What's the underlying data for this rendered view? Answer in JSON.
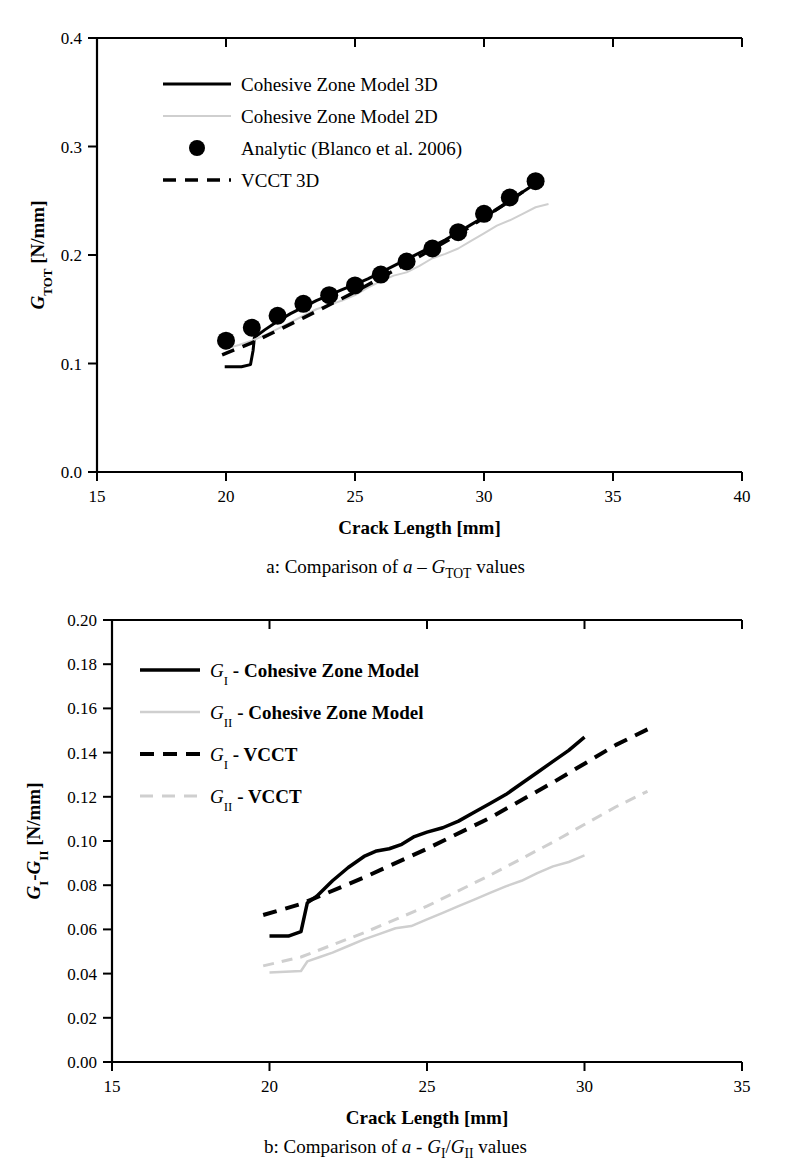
{
  "figure": {
    "panels": [
      {
        "id": "a",
        "caption_prefix": "a: Comparison of ",
        "caption_italic": "a",
        "caption_mid": " – ",
        "caption_sym": "G",
        "caption_sub": "TOT",
        "caption_suffix": " values"
      },
      {
        "id": "b",
        "caption_prefix": "b: Comparison of ",
        "caption_italic": "a",
        "caption_mid": " - ",
        "caption_sym1": "G",
        "caption_sub1": "I",
        "caption_slash": "/",
        "caption_sym2": "G",
        "caption_sub2": "II",
        "caption_suffix": " values"
      }
    ]
  },
  "chart_data": [
    {
      "type": "line",
      "panel": "a",
      "title": "",
      "xlabel": "Crack Length [mm]",
      "ylabel": "G_TOT [N/mm]",
      "ylabel_sym": "G",
      "ylabel_sub": "TOT",
      "ylabel_unit": " [N/mm]",
      "xlim": [
        15,
        40
      ],
      "ylim": [
        0.0,
        0.4
      ],
      "xticks": [
        15,
        20,
        25,
        30,
        35,
        40
      ],
      "xticklabels": [
        "15",
        "20",
        "25",
        "30",
        "35",
        "40"
      ],
      "yticks": [
        0.0,
        0.1,
        0.2,
        0.3,
        0.4
      ],
      "yticklabels": [
        "0.0",
        "0.1",
        "0.2",
        "0.3",
        "0.4"
      ],
      "grid": false,
      "legend_position": "upper-left",
      "series": [
        {
          "name": "Cohesive Zone Model 3D",
          "style": "solid",
          "color": "#000000",
          "width": 3,
          "x": [
            19.95,
            20.6,
            20.95,
            21.05,
            21.1,
            21.5,
            22.0,
            22.5,
            23.0,
            23.5,
            24.0,
            24.5,
            25.0,
            25.5,
            26.0,
            26.5,
            27.0,
            27.5,
            28.0,
            28.5,
            29.0,
            29.5,
            30.0,
            30.5,
            31.0,
            31.5,
            32.0
          ],
          "y": [
            0.097,
            0.097,
            0.099,
            0.112,
            0.124,
            0.131,
            0.139,
            0.146,
            0.152,
            0.158,
            0.163,
            0.168,
            0.173,
            0.178,
            0.184,
            0.19,
            0.196,
            0.202,
            0.208,
            0.214,
            0.221,
            0.228,
            0.235,
            0.242,
            0.25,
            0.258,
            0.266
          ]
        },
        {
          "name": "Cohesive Zone Model 2D",
          "style": "solid",
          "color": "#cfcfcf",
          "width": 2,
          "x": [
            19.9,
            20.5,
            21.0,
            21.5,
            22.0,
            22.5,
            23.0,
            23.5,
            24.0,
            24.5,
            25.0,
            25.5,
            26.0,
            26.5,
            27.0,
            27.5,
            28.0,
            28.5,
            29.0,
            29.5,
            30.0,
            30.5,
            31.0,
            31.5,
            32.0,
            32.5
          ],
          "y": [
            0.113,
            0.117,
            0.121,
            0.126,
            0.132,
            0.138,
            0.144,
            0.15,
            0.154,
            0.158,
            0.163,
            0.17,
            0.176,
            0.181,
            0.184,
            0.19,
            0.197,
            0.201,
            0.206,
            0.213,
            0.22,
            0.227,
            0.232,
            0.238,
            0.244,
            0.247
          ]
        },
        {
          "name": "Analytic (Blanco et al. 2006)",
          "style": "markers",
          "color": "#000000",
          "marker": "circle",
          "marker_size": 9,
          "x": [
            20,
            21,
            22,
            23,
            24,
            25,
            26,
            27,
            28,
            29,
            30,
            31,
            32
          ],
          "y": [
            0.121,
            0.133,
            0.144,
            0.155,
            0.163,
            0.172,
            0.182,
            0.194,
            0.206,
            0.221,
            0.238,
            0.253,
            0.268
          ]
        },
        {
          "name": "VCCT 3D",
          "style": "dashed",
          "color": "#000000",
          "width": 3.5,
          "x": [
            19.85,
            21.0,
            23.0,
            25.0,
            27.0,
            29.0,
            31.0,
            32.1
          ],
          "y": [
            0.108,
            0.119,
            0.142,
            0.166,
            0.192,
            0.219,
            0.25,
            0.268
          ]
        }
      ],
      "legend": [
        {
          "label": "Cohesive Zone Model 3D",
          "style": "solid",
          "color": "#000000",
          "width": 3
        },
        {
          "label": "Cohesive Zone Model 2D",
          "style": "solid",
          "color": "#cfcfcf",
          "width": 2
        },
        {
          "label": "Analytic (Blanco et al. 2006)",
          "style": "marker",
          "color": "#000000"
        },
        {
          "label": "VCCT 3D",
          "style": "dashed",
          "color": "#000000",
          "width": 3.5
        }
      ]
    },
    {
      "type": "line",
      "panel": "b",
      "title": "",
      "xlabel": "Crack Length [mm]",
      "ylabel": "G_I-G_II [N/mm]",
      "ylabel_sym1": "G",
      "ylabel_sub1": "I",
      "ylabel_dash": "-",
      "ylabel_sym2": "G",
      "ylabel_sub2": "II",
      "ylabel_unit": " [N/mm]",
      "xlim": [
        15,
        35
      ],
      "ylim": [
        0.0,
        0.2
      ],
      "xticks": [
        15,
        20,
        25,
        30,
        35
      ],
      "xticklabels": [
        "15",
        "20",
        "25",
        "30",
        "35"
      ],
      "yticks": [
        0.0,
        0.02,
        0.04,
        0.06,
        0.08,
        0.1,
        0.12,
        0.14,
        0.16,
        0.18,
        0.2
      ],
      "yticklabels": [
        "0.00",
        "0.02",
        "0.04",
        "0.06",
        "0.08",
        "0.10",
        "0.12",
        "0.14",
        "0.16",
        "0.18",
        "0.20"
      ],
      "grid": false,
      "legend_position": "upper-left",
      "series": [
        {
          "name": "G_I - Cohesive Zone Model",
          "style": "solid",
          "color": "#000000",
          "width": 3.5,
          "x": [
            20.0,
            20.6,
            21.0,
            21.2,
            21.5,
            22.0,
            22.5,
            23.0,
            23.4,
            23.8,
            24.2,
            24.6,
            25.0,
            25.5,
            26.0,
            26.5,
            27.0,
            27.5,
            28.0,
            28.5,
            29.0,
            29.5,
            30.0
          ],
          "y": [
            0.057,
            0.057,
            0.059,
            0.072,
            0.075,
            0.082,
            0.088,
            0.093,
            0.0955,
            0.0965,
            0.0985,
            0.102,
            0.104,
            0.106,
            0.109,
            0.113,
            0.117,
            0.121,
            0.126,
            0.131,
            0.136,
            0.141,
            0.147
          ]
        },
        {
          "name": "G_II - Cohesive Zone Model",
          "style": "solid",
          "color": "#cfcfcf",
          "width": 2.5,
          "x": [
            20.0,
            20.5,
            21.0,
            21.2,
            21.6,
            22.0,
            22.5,
            23.0,
            23.5,
            24.0,
            24.5,
            25.0,
            25.5,
            26.0,
            26.5,
            27.0,
            27.5,
            28.0,
            28.5,
            29.0,
            29.5,
            30.0
          ],
          "y": [
            0.0405,
            0.0408,
            0.0412,
            0.0455,
            0.0475,
            0.0495,
            0.0525,
            0.0555,
            0.058,
            0.0605,
            0.0615,
            0.0645,
            0.0675,
            0.0705,
            0.0735,
            0.0765,
            0.0795,
            0.082,
            0.0855,
            0.0885,
            0.0905,
            0.0935
          ]
        },
        {
          "name": "G_I - VCCT",
          "style": "dashed",
          "color": "#000000",
          "width": 4,
          "x": [
            19.8,
            21.0,
            23.0,
            25.0,
            27.0,
            29.0,
            31.0,
            32.0
          ],
          "y": [
            0.0665,
            0.0715,
            0.0835,
            0.0965,
            0.1105,
            0.1265,
            0.1435,
            0.1505
          ]
        },
        {
          "name": "G_II - VCCT",
          "style": "dashed",
          "color": "#cfcfcf",
          "width": 3,
          "x": [
            19.8,
            21.0,
            23.0,
            25.0,
            27.0,
            29.0,
            31.0,
            32.0
          ],
          "y": [
            0.0435,
            0.0475,
            0.0585,
            0.0705,
            0.0845,
            0.0995,
            0.1155,
            0.1225
          ]
        }
      ],
      "legend": [
        {
          "label": " - Cohesive Zone Model",
          "sym": "G",
          "sub": "I",
          "style": "solid",
          "color": "#000000",
          "width": 3.5
        },
        {
          "label": " - Cohesive Zone Model",
          "sym": "G",
          "sub": "II",
          "style": "solid",
          "color": "#cfcfcf",
          "width": 2.5
        },
        {
          "label": " - VCCT",
          "sym": "G",
          "sub": "I",
          "style": "dashed",
          "color": "#000000",
          "width": 4
        },
        {
          "label": " - VCCT",
          "sym": "G",
          "sub": "II",
          "style": "dashed",
          "color": "#cfcfcf",
          "width": 3
        }
      ]
    }
  ]
}
